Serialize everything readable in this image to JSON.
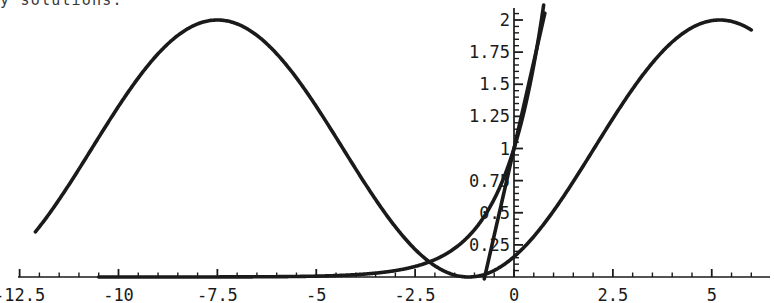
{
  "caption": {
    "text": "y solutions."
  },
  "chart_data": {
    "type": "line",
    "title": "",
    "xlabel": "",
    "ylabel": "",
    "grid": false,
    "legend": "none",
    "xlim": [
      -13.0,
      6.45
    ],
    "ylim": [
      0,
      2.08
    ],
    "axes": {
      "main_x_axis_y_value": 0,
      "inset_y_axis_x_value": 0,
      "x_ticks_major": [
        -12.5,
        -10,
        -7.5,
        -5,
        -2.5,
        0,
        2.5,
        5
      ],
      "x_tick_labels": [
        "-12.5",
        "-10",
        "-7.5",
        "-5",
        "-2.5",
        "0",
        "2.5",
        "5"
      ],
      "x_minor_tick_step": 0.5,
      "y_ticks_major": [
        0.25,
        0.5,
        0.75,
        1,
        1.25,
        1.5,
        1.75,
        2
      ],
      "y_tick_labels": [
        "0.25",
        "0.5",
        "0.75",
        "1",
        "1.25",
        "1.5",
        "1.75",
        "2"
      ],
      "y_minor_tick_step": 0.05
    },
    "series": [
      {
        "name": "oscillatory-solution",
        "kind": "cosine-squared",
        "stroke": "#1a1a1a",
        "width": 3.6,
        "formula": "1 + cos(pi*(x + 7.5)/6.35)",
        "domain": [
          -12.1,
          6.0
        ],
        "peaks": [
          {
            "x": -11.0,
            "y": 2.0
          },
          {
            "x": -4.6,
            "y": 2.0
          },
          {
            "x": 1.8,
            "y": 2.0
          }
        ],
        "zeros": [
          -7.5,
          -1.5,
          4.7
        ]
      },
      {
        "name": "exponential-solution",
        "kind": "exponential",
        "stroke": "#1a1a1a",
        "width": 3.6,
        "formula": "exp(x)",
        "domain": [
          -10.5,
          0.75
        ],
        "points": [
          {
            "x": -6.0,
            "y": 0.0025
          },
          {
            "x": -4.0,
            "y": 0.018
          },
          {
            "x": -3.0,
            "y": 0.05
          },
          {
            "x": -2.0,
            "y": 0.135
          },
          {
            "x": -1.0,
            "y": 0.368
          },
          {
            "x": 0.0,
            "y": 1.0
          },
          {
            "x": 0.5,
            "y": 1.649
          },
          {
            "x": 0.72,
            "y": 2.05
          }
        ]
      },
      {
        "name": "linear-solution",
        "kind": "line",
        "stroke": "#1a1a1a",
        "width": 3.6,
        "formula": "1 + 1.35*x",
        "domain": [
          -2.6,
          0.78
        ],
        "points": [
          {
            "x": -2.6,
            "y": 0.0
          },
          {
            "x": 0.0,
            "y": 1.0
          },
          {
            "x": 0.78,
            "y": 2.06
          }
        ]
      }
    ],
    "colors": {
      "curve": "#1a1a1a",
      "axis": "#1a1a1a",
      "background": "#ffffff",
      "caption": "#3a3a3a"
    }
  }
}
